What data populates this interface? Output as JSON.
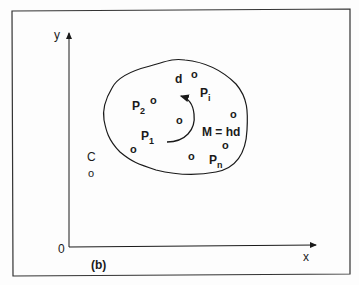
{
  "figure": {
    "panel_label": "(b)",
    "axes": {
      "x_label": "x",
      "y_label": "y",
      "origin_label": "0"
    },
    "outside_point": {
      "label": "C",
      "marker": "o"
    },
    "points": [
      {
        "id": "d",
        "label": "d",
        "marker": "o"
      },
      {
        "id": "P2",
        "label": "P",
        "sub": "2",
        "marker": "o"
      },
      {
        "id": "Pi",
        "label": "P",
        "sub": "i",
        "marker": "o"
      },
      {
        "id": "P1",
        "label": "P",
        "sub": "1",
        "marker": "o"
      },
      {
        "id": "Pn",
        "label": "P",
        "sub": "n",
        "marker": "o"
      },
      {
        "id": "center",
        "marker": "o"
      },
      {
        "id": "mid",
        "marker": "o"
      },
      {
        "id": "right",
        "marker": "o"
      }
    ],
    "moment_label": "M = hd",
    "colors": {
      "ink": "#1a1a1a",
      "frame": "#333333",
      "background": "#fdfdfd"
    }
  }
}
